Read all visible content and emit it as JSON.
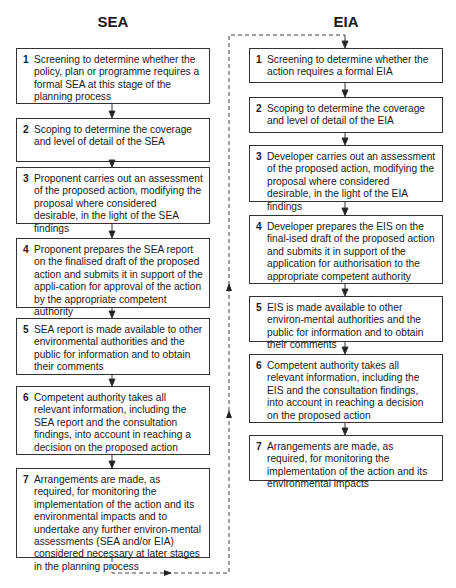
{
  "sea": {
    "title": "SEA",
    "steps": [
      {
        "num": "1",
        "text": "Screening to determine whether the policy, plan or programme requires a formal SEA at this stage of the planning process"
      },
      {
        "num": "2",
        "text": "Scoping to determine the coverage and level of detail of the SEA"
      },
      {
        "num": "3",
        "text": "Proponent carries out an assessment of the proposed action, modifying the proposal where considered desirable, in the light of the SEA findings"
      },
      {
        "num": "4",
        "text": "Proponent prepares the SEA report on the finalised draft of the proposed action and submits it in support of the appli-cation for approval of the action by the appropriate competent authority"
      },
      {
        "num": "5",
        "text": "SEA report is made available to other environmental authorities and the public for information and to obtain their comments"
      },
      {
        "num": "6",
        "text": "Competent authority takes all relevant information, including the SEA report and the consultation findings, into account in reaching a decision on the proposed action"
      },
      {
        "num": "7",
        "text": "Arrangements are made, as required, for monitoring the implementation of the action and its environmental impacts and to undertake any further environ-mental assessments (SEA and/or EIA) considered necessary at later stages in the planning process"
      }
    ]
  },
  "eia": {
    "title": "EIA",
    "steps": [
      {
        "num": "1",
        "text": "Screening to determine whether the action requires a formal EIA"
      },
      {
        "num": "2",
        "text": "Scoping to determine the coverage and level of detail of the EIA"
      },
      {
        "num": "3",
        "text": "Developer carries out an assessment of the proposed action, modifying the proposal where considered desirable, in the light of the EIA findings"
      },
      {
        "num": "4",
        "text": "Developer prepares the EIS on the final-ised draft of the proposed action and submits it in support of the application for authorisation to the appropriate competent authority"
      },
      {
        "num": "5",
        "text": "EIS is made available to other environ-mental authorities and the public for information and to obtain their comments"
      },
      {
        "num": "6",
        "text": "Competent authority takes all relevant information, including the EIS and the consultation findings, into account in reaching a decision on the proposed action"
      },
      {
        "num": "7",
        "text": "Arrangements are made, as required, for monitoring the implementation of the action and its environmental impacts"
      }
    ]
  },
  "connector": {
    "style": "dashed",
    "from": "SEA step 7",
    "to": "EIA step 1"
  }
}
